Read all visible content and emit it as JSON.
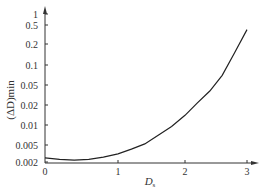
{
  "chart_data": {
    "type": "line",
    "title": "",
    "xlabel": "Ds",
    "xlabel_main": "D",
    "xlabel_sub": "s",
    "ylabel": "(ΔD)min",
    "y_scale": "log",
    "xlim": [
      0,
      3
    ],
    "ylim": [
      0.002,
      1
    ],
    "x_ticks": [
      "0",
      "1",
      "2",
      "3"
    ],
    "y_ticks": [
      "1",
      "0.5",
      "0.2",
      "0.1",
      "0.05",
      "0.02",
      "0.01",
      "0.005",
      "0.002"
    ],
    "grid": false,
    "legend": null,
    "series": [
      {
        "name": "(ΔD)min",
        "x": [
          0,
          0.2,
          0.4,
          0.6,
          0.8,
          1.0,
          1.2,
          1.4,
          1.6,
          1.8,
          2.0,
          2.2,
          2.4,
          2.6,
          2.8,
          3.0
        ],
        "y": [
          0.0025,
          0.0023,
          0.0022,
          0.0023,
          0.0026,
          0.0031,
          0.004,
          0.0052,
          0.007,
          0.0095,
          0.014,
          0.022,
          0.038,
          0.07,
          0.15,
          0.4
        ]
      }
    ]
  },
  "axes": {
    "y_label": "(ΔD)min",
    "x_label_main": "D",
    "x_label_sub": "s"
  }
}
